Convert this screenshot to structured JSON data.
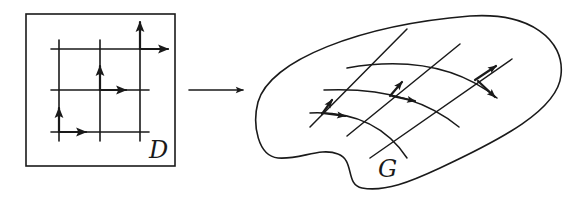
{
  "figure": {
    "domain_label": "D",
    "image_label": "G",
    "mapping_arrow": "right-arrow",
    "colors": {
      "ink": "#1a1a1a",
      "background": "#ffffff"
    }
  },
  "left_panel": {
    "frame": {
      "x": 26,
      "y": 14,
      "w": 150,
      "h": 152
    },
    "vertical_lines_x": [
      59,
      100,
      140
    ],
    "horizontal_lines_y": [
      49,
      90,
      132
    ],
    "vector_pairs": [
      {
        "origin": [
          59,
          132
        ],
        "up_to": [
          59,
          108
        ],
        "right_to": [
          85,
          132
        ]
      },
      {
        "origin": [
          100,
          90
        ],
        "up_to": [
          100,
          66
        ],
        "right_to": [
          125,
          90
        ]
      },
      {
        "origin": [
          140,
          49
        ],
        "up_to": [
          140,
          22
        ],
        "right_to": [
          167,
          49
        ]
      }
    ]
  },
  "right_panel": {
    "region_name": "G",
    "curves_u": 3,
    "curves_v": 3,
    "vector_pairs": 3
  }
}
